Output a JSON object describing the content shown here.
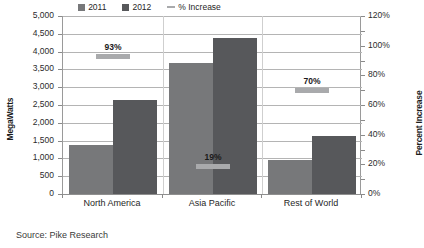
{
  "source": {
    "text": "Source: Pike Research"
  },
  "legend": {
    "items": [
      {
        "label": "2011",
        "marker": "square-swatch",
        "color": "#77787a"
      },
      {
        "label": "2012",
        "marker": "square-swatch",
        "color": "#57585b"
      },
      {
        "label": "% Increase",
        "marker": "dash-line",
        "color": "#a9aaac"
      }
    ]
  },
  "chart_data": {
    "type": "bar",
    "title": "",
    "xlabel": "",
    "ylabel": "MegaWatts",
    "y2label": "Percent Increase",
    "categories": [
      "North America",
      "Asia Pacific",
      "Rest of World"
    ],
    "series": [
      {
        "name": "2011",
        "axis": "left",
        "color": "#77787a",
        "values": [
          1370,
          3670,
          960
        ]
      },
      {
        "name": "2012",
        "axis": "left",
        "color": "#57585b",
        "values": [
          2650,
          4370,
          1630
        ]
      },
      {
        "name": "% Increase",
        "axis": "right",
        "color": "#a9aaac",
        "type": "marker",
        "values": [
          93,
          19,
          70
        ],
        "labels": [
          "93%",
          "19%",
          "70%"
        ]
      }
    ],
    "ylim": [
      0,
      5000
    ],
    "ytick_step": 500,
    "yticks": [
      "0",
      "500",
      "1,000",
      "1,500",
      "2,000",
      "2,500",
      "3,000",
      "3,500",
      "4,000",
      "4,500",
      "5,000"
    ],
    "y2lim": [
      0,
      120
    ],
    "y2tick_step": 20,
    "y2ticks": [
      "0%",
      "20%",
      "40%",
      "60%",
      "80%",
      "100%",
      "120%"
    ],
    "grid": true,
    "legend_position": "bottom"
  }
}
